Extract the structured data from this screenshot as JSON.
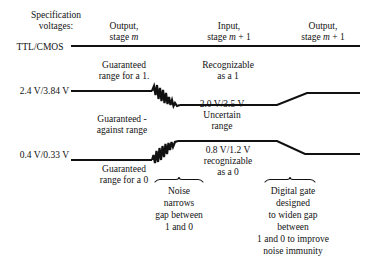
{
  "figure": {
    "spec_label_line1": "Specification",
    "spec_label_line2": "voltages:",
    "spec_label_line3": "TTL/CMOS"
  },
  "columns": [
    {
      "line1": "Output,",
      "line2_prefix": "stage ",
      "line2_italic": "m",
      "line2_suffix": ""
    },
    {
      "line1": "Input,",
      "line2_prefix": "stage ",
      "line2_italic": "m",
      "line2_suffix": " + 1"
    },
    {
      "line1": "Output,",
      "line2_prefix": "stage ",
      "line2_italic": "m",
      "line2_suffix": " + 1"
    }
  ],
  "voltages": {
    "high_spec": "2.4 V/3.84 V",
    "low_spec": "0.4 V/0.33 V",
    "uncertain_high": "2.0 V/3.5 V",
    "uncertain_low": "0.8 V/1.2 V"
  },
  "annotations": {
    "guaranteed_one_line1": "Guaranteed",
    "guaranteed_one_line2": "range for a 1.",
    "recognizable_one_line1": "Recognizable",
    "recognizable_one_line2": "as a 1",
    "guaranteed_against_line1": "Guaranteed -",
    "guaranteed_against_line2": "against range",
    "uncertain_line1": "Uncertain",
    "uncertain_line2": "range",
    "guaranteed_zero_line1": "Guaranteed",
    "guaranteed_zero_line2": "range for a 0",
    "recognizable_zero_line1": "recognizable",
    "recognizable_zero_line2": "as a 0",
    "noise_caption_line1": "Noise",
    "noise_caption_line2": "narrows",
    "noise_caption_line3": "gap between",
    "noise_caption_line4": "1 and 0",
    "gate_caption_line1": "Digital gate",
    "gate_caption_line2": "designed",
    "gate_caption_line3": "to widen gap",
    "gate_caption_line4": "between",
    "gate_caption_line5": "1 and 0 to improve",
    "gate_caption_line6": "noise immunity"
  },
  "colors": {
    "ink": "#111111",
    "background": "#ffffff"
  }
}
